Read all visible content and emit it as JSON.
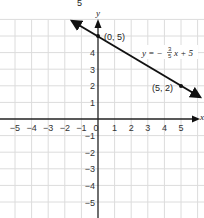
{
  "chart_data": {
    "type": "line",
    "title": "",
    "xlabel": "x",
    "ylabel": "y",
    "xlim": [
      -6,
      6
    ],
    "ylim": [
      -6,
      6
    ],
    "grid": true,
    "x_ticks": [
      "-5",
      "-4",
      "-3",
      "-2",
      "-1",
      "0",
      "1",
      "2",
      "3",
      "4",
      "5"
    ],
    "y_ticks": [
      "5",
      "4",
      "3",
      "2",
      "1",
      "-1",
      "-2",
      "-3",
      "-4",
      "-5"
    ],
    "series": [
      {
        "name": "y = -3/5 x + 5",
        "slope": -0.6,
        "intercept": 5,
        "x": [
          -1.5,
          6.4
        ],
        "y": [
          5.9,
          1.16
        ]
      }
    ],
    "points": [
      {
        "x": 0,
        "y": 5,
        "label": "(0, 5)"
      },
      {
        "x": 5,
        "y": 2,
        "label": "(5, 2)"
      }
    ],
    "annotations": {
      "equation": "y = −3/5x + 5",
      "top_fragment": "5"
    }
  },
  "labels": {
    "top_fragment": "5",
    "x_axis": "x",
    "y_axis": "y",
    "point_a": "(0, 5)",
    "point_b": "(5, 2)",
    "eq_prefix": "y = −",
    "eq_num": "3",
    "eq_den": "5",
    "eq_suffix": "x + 5",
    "origin": "0"
  },
  "colors": {
    "grid": "#d9d9d9",
    "axis": "#222222",
    "line": "#111111"
  }
}
